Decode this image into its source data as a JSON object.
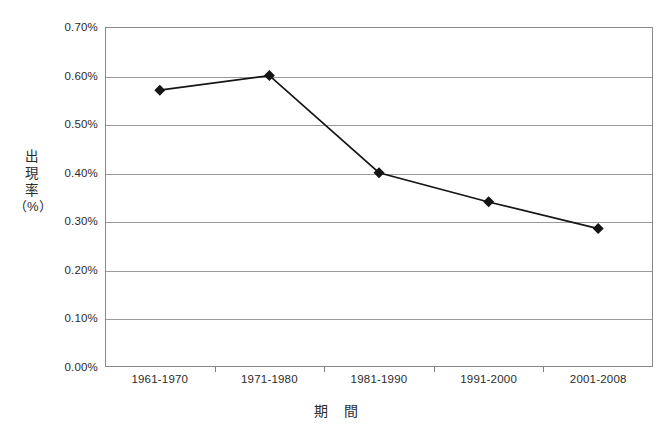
{
  "chart_data": {
    "type": "line",
    "title": "",
    "categories": [
      "1961-1970",
      "1971-1980",
      "1981-1990",
      "1991-2000",
      "2001-2008"
    ],
    "values": [
      0.57,
      0.6,
      0.4,
      0.34,
      0.285
    ],
    "xlabel": "期　間",
    "ylabel": "出現率（%）",
    "ylim": [
      0.0,
      0.7
    ],
    "ytick_labels": [
      "0.70%",
      "0.60%",
      "0.50%",
      "0.40%",
      "0.30%",
      "0.20%",
      "0.10%",
      "0.00%"
    ],
    "ytick_values": [
      0.7,
      0.6,
      0.5,
      0.4,
      0.3,
      0.2,
      0.1,
      0.0
    ],
    "value_unit": "%",
    "grid": "horizontal",
    "legend": "none",
    "marker": "diamond",
    "series_color": "#151515",
    "grid_color": "#9a9a9a",
    "frame_color": "#8a8a8a",
    "background_color": "#ffffff"
  },
  "y_axis_title_chars": [
    "出",
    "現",
    "率",
    "（%）"
  ]
}
